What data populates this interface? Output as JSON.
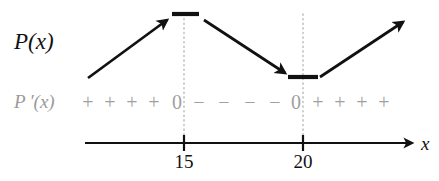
{
  "figure": {
    "title_text": "",
    "function_label": "P(x)",
    "derivative_label": "P ′(x)",
    "axis_label": "x",
    "colors": {
      "curve": "#111111",
      "sign_row": "#a0a0a0",
      "axis": "#111111",
      "dotted_guide": "#b8b8b8",
      "background": "#ffffff"
    }
  },
  "sign_row": {
    "label": "P ′(x)",
    "entries": [
      {
        "text": "+",
        "x": 88,
        "kind": "plus"
      },
      {
        "text": "+",
        "x": 110,
        "kind": "plus"
      },
      {
        "text": "+",
        "x": 132,
        "kind": "plus"
      },
      {
        "text": "+",
        "x": 154,
        "kind": "plus"
      },
      {
        "text": "0",
        "x": 177,
        "kind": "zero"
      },
      {
        "text": "−",
        "x": 199,
        "kind": "minus"
      },
      {
        "text": "−",
        "x": 224,
        "kind": "minus"
      },
      {
        "text": "−",
        "x": 250,
        "kind": "minus"
      },
      {
        "text": "−",
        "x": 275,
        "kind": "minus"
      },
      {
        "text": "0",
        "x": 296,
        "kind": "zero"
      },
      {
        "text": "+",
        "x": 318,
        "kind": "plus"
      },
      {
        "text": "+",
        "x": 340,
        "kind": "plus"
      },
      {
        "text": "+",
        "x": 362,
        "kind": "plus"
      },
      {
        "text": "+",
        "x": 384,
        "kind": "plus"
      }
    ]
  },
  "number_line": {
    "start_x": 85,
    "end_x": 412,
    "y": 143,
    "arrow_direction": "right",
    "ticks": [
      {
        "label": "15",
        "x": 184
      },
      {
        "label": "20",
        "x": 303
      }
    ]
  },
  "guides": [
    {
      "x": 184,
      "y_top": 14,
      "y_bottom": 143
    },
    {
      "x": 303,
      "y_top": 14,
      "y_bottom": 143
    }
  ],
  "chart_data": {
    "type": "line",
    "title": "",
    "xlabel": "x",
    "ylabel": "",
    "critical_points": [
      15,
      20
    ],
    "sign_intervals": [
      {
        "interval": "x < 15",
        "derivative_sign": "+",
        "behavior": "increasing"
      },
      {
        "interval": "x = 15",
        "derivative_sign": "0",
        "behavior": "local maximum"
      },
      {
        "interval": "15 < x < 20",
        "derivative_sign": "−",
        "behavior": "decreasing"
      },
      {
        "interval": "x = 20",
        "derivative_sign": "0",
        "behavior": "local minimum"
      },
      {
        "interval": "x > 20",
        "derivative_sign": "+",
        "behavior": "increasing"
      }
    ],
    "arrows": [
      {
        "name": "increasing-arrow-left",
        "x1": 88,
        "y1": 78,
        "x2": 167,
        "y2": 20
      },
      {
        "name": "decreasing-arrow-middle",
        "x1": 204,
        "y1": 20,
        "x2": 285,
        "y2": 73
      },
      {
        "name": "increasing-arrow-right",
        "x1": 320,
        "y1": 77,
        "x2": 403,
        "y2": 22
      }
    ],
    "plateaus": [
      {
        "name": "max-plateau-dash",
        "x1": 172,
        "x2": 199,
        "y": 14
      },
      {
        "name": "min-plateau-dash",
        "x1": 288,
        "x2": 318,
        "y": 77
      }
    ],
    "grid": false,
    "legend": "none"
  }
}
